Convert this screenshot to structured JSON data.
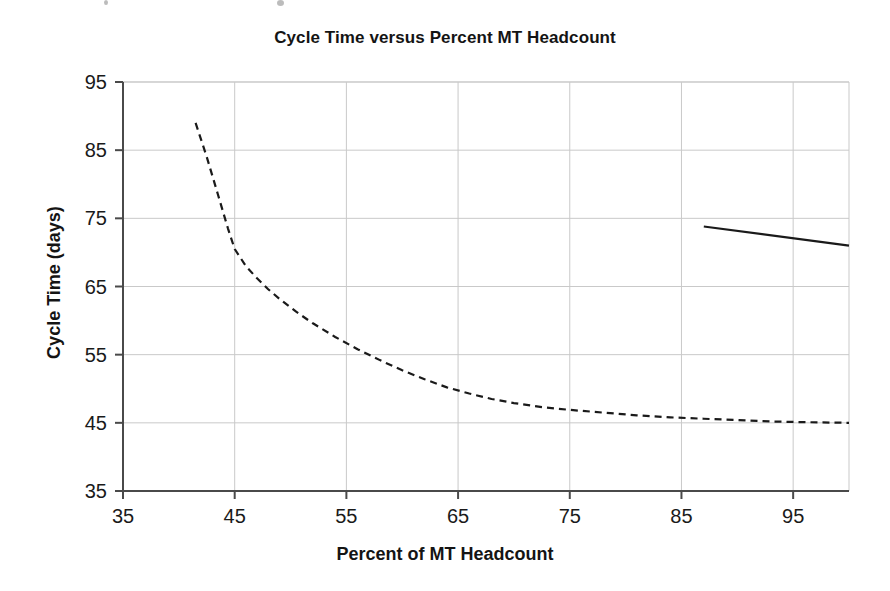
{
  "figure": {
    "title": "Cycle Time versus Percent MT Headcount",
    "background_color": "#ffffff",
    "ink_color": "#1a1a1a",
    "grid_color": "#c9c9c9",
    "axis_color": "#4a4a4a"
  },
  "chart_data": {
    "type": "line",
    "title": "Cycle Time versus Percent MT Headcount",
    "xlabel": "Percent of MT Headcount",
    "ylabel": "Cycle Time (days)",
    "xlim": [
      35,
      100
    ],
    "ylim": [
      35,
      95
    ],
    "xticks": [
      35,
      45,
      55,
      65,
      75,
      85,
      95
    ],
    "yticks": [
      35,
      45,
      55,
      65,
      75,
      85,
      95
    ],
    "xtick_labels": [
      "35",
      "45",
      "55",
      "65",
      "75",
      "85",
      "95"
    ],
    "ytick_labels": [
      "35",
      "45",
      "55",
      "65",
      "75",
      "85",
      "95"
    ],
    "grid": true,
    "grid_axis": "both",
    "legend": false,
    "legend_position": "none",
    "series": [
      {
        "name": "Cycle time curve",
        "style": "dashed",
        "color": "#1a1a1a",
        "linewidth": 2.2,
        "dash_pattern": [
          7,
          5
        ],
        "x": [
          41.5,
          42.5,
          43.5,
          44.4,
          45.0,
          46.0,
          47.0,
          48.0,
          49.0,
          50.5,
          52.0,
          54.0,
          56.0,
          58.0,
          60.0,
          62.0,
          64.0,
          66.0,
          68.0,
          70.0,
          72.5,
          75.0,
          78.0,
          81.0,
          84.0,
          87.0,
          90.0,
          93.0,
          96.0,
          100.0
        ],
        "y": [
          89.0,
          84.0,
          78.5,
          73.5,
          70.5,
          68.0,
          66.2,
          64.6,
          63.2,
          61.3,
          59.6,
          57.6,
          55.8,
          54.2,
          52.7,
          51.4,
          50.2,
          49.3,
          48.5,
          47.9,
          47.3,
          46.9,
          46.5,
          46.1,
          45.8,
          45.6,
          45.4,
          45.2,
          45.1,
          45.0
        ]
      },
      {
        "name": "Reference line",
        "style": "solid",
        "color": "#1a1a1a",
        "linewidth": 2.2,
        "x": [
          87.0,
          100.0
        ],
        "y": [
          73.8,
          71.0
        ]
      }
    ]
  },
  "annotations": {
    "scan_artifacts": [
      {
        "x": 105,
        "y": 1,
        "size": 4
      },
      {
        "x": 279,
        "y": 1,
        "size": 6
      }
    ]
  }
}
